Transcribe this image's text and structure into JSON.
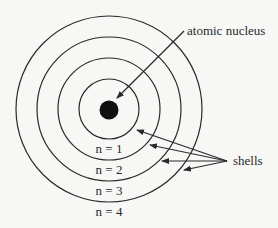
{
  "diagram": {
    "labels": {
      "nucleus": "atomic nucleus",
      "shells": "shells"
    },
    "shells": [
      {
        "name": "n = 1",
        "radius": 30
      },
      {
        "name": "n = 2",
        "radius": 51
      },
      {
        "name": "n = 3",
        "radius": 72
      },
      {
        "name": "n = 4",
        "radius": 93
      }
    ],
    "colors": {
      "background": "#f7f7f5",
      "line": "#2a2a2a",
      "nucleus": "#111111"
    }
  }
}
